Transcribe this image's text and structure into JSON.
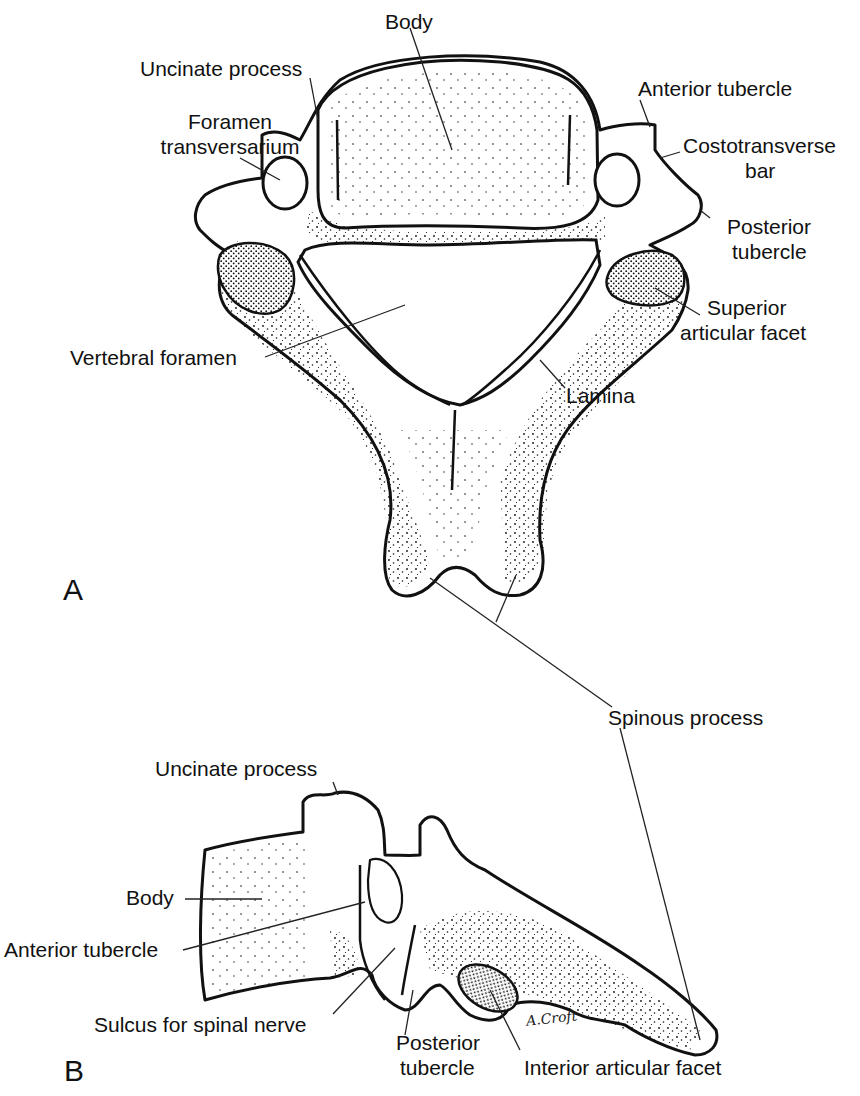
{
  "figure": {
    "panels": [
      {
        "id": "A",
        "letter": "A",
        "view": "superior",
        "labels": {
          "body": "Body",
          "uncinate_process": "Uncinate process",
          "foramen_transversarium_1": "Foramen",
          "foramen_transversarium_2": "transversarium",
          "anterior_tubercle": "Anterior tubercle",
          "costotransverse_bar_1": "Costotransverse",
          "costotransverse_bar_2": "bar",
          "posterior_tubercle_1": "Posterior",
          "posterior_tubercle_2": "tubercle",
          "superior_articular_facet_1": "Superior",
          "superior_articular_facet_2": "articular facet",
          "vertebral_foramen": "Vertebral foramen",
          "lamina": "Lamina"
        }
      },
      {
        "id": "B",
        "letter": "B",
        "view": "lateral",
        "labels": {
          "uncinate_process": "Uncinate process",
          "body": "Body",
          "anterior_tubercle": "Anterior tubercle",
          "sulcus_for_spinal_nerve": "Sulcus for spinal nerve",
          "posterior_tubercle_1": "Posterior",
          "posterior_tubercle_2": "tubercle",
          "interior_articular_facet": "Interior articular facet"
        }
      }
    ],
    "shared_labels": {
      "spinous_process": "Spinous process"
    },
    "signature": "A.Croft"
  }
}
